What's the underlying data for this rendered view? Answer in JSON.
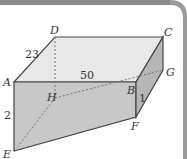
{
  "figure": {
    "type": "rectangular-prism-diagram",
    "vertices": {
      "A": {
        "label": "A"
      },
      "B": {
        "label": "B"
      },
      "C": {
        "label": "C"
      },
      "D": {
        "label": "D"
      },
      "E": {
        "label": "E"
      },
      "F": {
        "label": "F"
      },
      "G": {
        "label": "G"
      },
      "H": {
        "label": "H"
      }
    },
    "dimensions": {
      "AD": "23",
      "AB": "50",
      "AE": "2",
      "BF": "1"
    },
    "hidden_edges": [
      "DH",
      "HE",
      "HG"
    ],
    "colors": {
      "header_band": "#8a8a8a",
      "top_face": "#e8e8e8",
      "front_face": "#c6c6c6",
      "side_face": "#b8b8b8",
      "edge": "#444444",
      "hidden_edge": "#777777",
      "border": "#d0d0d0"
    }
  }
}
